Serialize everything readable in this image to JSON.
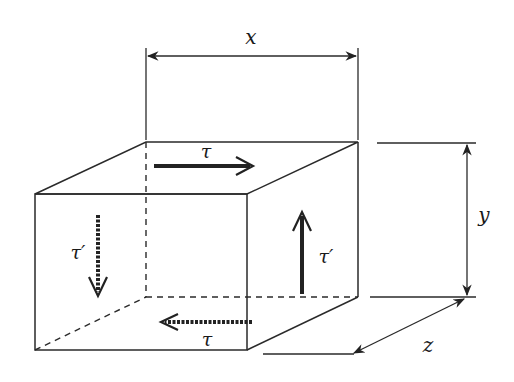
{
  "diagram": {
    "colors": {
      "stroke": "#2a2a2a",
      "background": "#ffffff"
    },
    "dimensions": {
      "x": {
        "label": "x"
      },
      "y": {
        "label": "y"
      },
      "z": {
        "label": "z"
      }
    },
    "stresses": {
      "top_face": {
        "label": "τ",
        "direction": "right",
        "style": "solid"
      },
      "bottom_face": {
        "label": "τ",
        "direction": "left",
        "style": "dashed"
      },
      "right_face": {
        "label": "τ′",
        "direction": "up",
        "style": "solid"
      },
      "left_face": {
        "label": "τ′",
        "direction": "down",
        "style": "dashed"
      }
    }
  }
}
